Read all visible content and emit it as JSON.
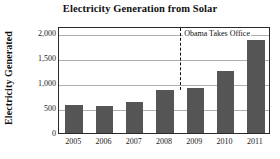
{
  "chart_data": {
    "type": "bar",
    "title": "Electricity Generation from Solar",
    "xlabel": "",
    "ylabel": "Electricity Generated",
    "categories": [
      "2005",
      "2006",
      "2007",
      "2008",
      "2009",
      "2010",
      "2011"
    ],
    "values": [
      570,
      540,
      620,
      870,
      905,
      1245,
      1870
    ],
    "series": [
      {
        "name": "Electricity Generated",
        "values": [
          570,
          540,
          620,
          870,
          905,
          1245,
          1870
        ]
      }
    ],
    "ylim": [
      0,
      2150
    ],
    "yticks": [
      0,
      500,
      1000,
      1500,
      2000
    ],
    "ytick_labels": [
      "0",
      "500",
      "1,000",
      "1,500",
      "2,000"
    ],
    "grid": "horizontal",
    "legend": "none",
    "bar_color": "#555555",
    "gridline_color": "#b0b0b0",
    "axis_color": "#2a2a2a",
    "annotations": [
      {
        "text": "Obama Takes Office",
        "type": "vertical-dashed-line-with-label",
        "position_between": [
          "2008",
          "2009"
        ],
        "line_style": "dashed",
        "line_color": "#111111"
      }
    ]
  }
}
